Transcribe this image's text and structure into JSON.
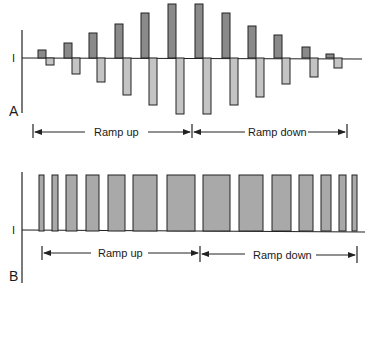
{
  "colors": {
    "dark_bar": "#8a8a8a",
    "light_bar": "#c4c4c4",
    "panel_b_bar": "#a9a9a9",
    "stroke": "#222222"
  },
  "panel_a": {
    "label": "A",
    "axis_label": "I",
    "ramp_up_label": "Ramp up",
    "ramp_down_label": "Ramp down",
    "baseline_y": 58,
    "pairs": [
      {
        "dx": 38,
        "top": 50,
        "lx": 46,
        "bottom": 65
      },
      {
        "dx": 64,
        "top": 43,
        "lx": 72,
        "bottom": 74
      },
      {
        "dx": 89,
        "top": 33,
        "lx": 97,
        "bottom": 82
      },
      {
        "dx": 115,
        "top": 24,
        "lx": 123,
        "bottom": 95
      },
      {
        "dx": 141,
        "top": 13,
        "lx": 149,
        "bottom": 105
      },
      {
        "dx": 168,
        "top": 4,
        "lx": 176,
        "bottom": 114
      },
      {
        "dx": 195,
        "top": 4,
        "lx": 203,
        "bottom": 114
      },
      {
        "dx": 222,
        "top": 13,
        "lx": 230,
        "bottom": 105
      },
      {
        "dx": 248,
        "top": 26,
        "lx": 256,
        "bottom": 97
      },
      {
        "dx": 274,
        "top": 35,
        "lx": 282,
        "bottom": 84
      },
      {
        "dx": 302,
        "top": 47,
        "lx": 310,
        "bottom": 77
      },
      {
        "dx": 326,
        "top": 54,
        "lx": 334,
        "bottom": 68
      }
    ]
  },
  "panel_b": {
    "label": "B",
    "axis_label": "I",
    "ramp_up_label": "Ramp up",
    "ramp_down_label": "Ramp down",
    "baseline_y": 231,
    "bars": [
      {
        "x": 39,
        "w": 5
      },
      {
        "x": 52,
        "w": 6
      },
      {
        "x": 66,
        "w": 11
      },
      {
        "x": 86,
        "w": 13
      },
      {
        "x": 108,
        "w": 17
      },
      {
        "x": 133,
        "w": 24
      },
      {
        "x": 167,
        "w": 28
      },
      {
        "x": 203,
        "w": 27
      },
      {
        "x": 239,
        "w": 24
      },
      {
        "x": 272,
        "w": 19
      },
      {
        "x": 299,
        "w": 14
      },
      {
        "x": 321,
        "w": 10
      },
      {
        "x": 339,
        "w": 7
      },
      {
        "x": 352,
        "w": 5
      }
    ]
  }
}
